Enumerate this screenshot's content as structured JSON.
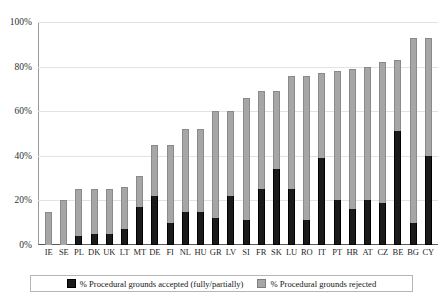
{
  "chart_data": {
    "type": "bar",
    "subtype": "stacked-vertical",
    "title": "",
    "subtitle": "",
    "xlabel": "",
    "ylabel": "",
    "ylim": [
      0,
      100
    ],
    "yticks": [
      "0%",
      "20%",
      "40%",
      "60%",
      "80%",
      "100%"
    ],
    "ytick_values": [
      0,
      20,
      40,
      60,
      80,
      100
    ],
    "grid": true,
    "legend_position": "bottom",
    "categories": [
      "IE",
      "SE",
      "PL",
      "DK",
      "UK",
      "LT",
      "MT",
      "DE",
      "FI",
      "NL",
      "HU",
      "GR",
      "LV",
      "SI",
      "FR",
      "SK",
      "LU",
      "RO",
      "IT",
      "PT",
      "HR",
      "AT",
      "CZ",
      "BE",
      "BG",
      "CY"
    ],
    "series": [
      {
        "name": "% Procedural grounds accepted (fully/partially)",
        "color": "#1a1a1a",
        "values": [
          0,
          0,
          4,
          5,
          5,
          7,
          17,
          22,
          10,
          15,
          15,
          12,
          22,
          11,
          25,
          34,
          25,
          11,
          39,
          20,
          16,
          20,
          19,
          51,
          10,
          40
        ]
      },
      {
        "name": "% Procedural grounds rejected",
        "color": "#a6a6a6",
        "values": [
          15,
          20,
          21,
          20,
          20,
          19,
          14,
          23,
          35,
          37,
          37,
          48,
          38,
          55,
          44,
          35,
          51,
          65,
          38,
          58,
          63,
          60,
          63,
          32,
          83,
          53
        ]
      }
    ],
    "totals": [
      15,
      20,
      25,
      25,
      25,
      26,
      31,
      45,
      45,
      52,
      52,
      60,
      60,
      66,
      69,
      69,
      76,
      76,
      77,
      78,
      79,
      80,
      82,
      83,
      93,
      93
    ]
  },
  "legend": {
    "entries": [
      {
        "label": "% Procedural grounds accepted (fully/partially)",
        "swatch": "accepted-swatch"
      },
      {
        "label": "% Procedural grounds rejected",
        "swatch": "rejected-swatch"
      }
    ]
  }
}
